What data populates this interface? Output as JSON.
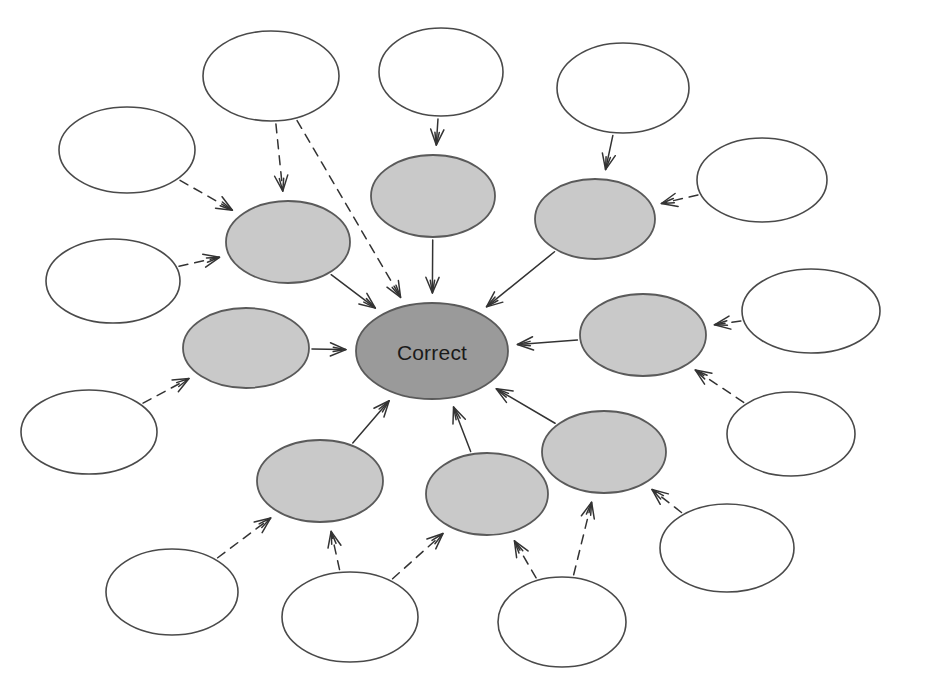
{
  "diagram": {
    "canvas": {
      "width": 925,
      "height": 688,
      "background": "#ffffff"
    },
    "palette": {
      "center_fill": "#9a9a9a",
      "inner_fill": "#c9c9c9",
      "outer_fill": "#ffffff",
      "stroke": "#4a4a4a",
      "edge": "#333333",
      "label": "#1a1a1a"
    },
    "center_node": {
      "id": "center",
      "label": "Correct",
      "cx": 432,
      "cy": 351,
      "rx": 76,
      "ry": 48,
      "fill": "#9a9a9a"
    },
    "inner_nodes": [
      {
        "id": "inner-nw",
        "label": "",
        "cx": 288,
        "cy": 242,
        "rx": 62,
        "ry": 41
      },
      {
        "id": "inner-n",
        "label": "",
        "cx": 433,
        "cy": 196,
        "rx": 62,
        "ry": 41
      },
      {
        "id": "inner-ne",
        "label": "",
        "cx": 595,
        "cy": 219,
        "rx": 60,
        "ry": 40
      },
      {
        "id": "inner-e",
        "label": "",
        "cx": 643,
        "cy": 335,
        "rx": 63,
        "ry": 41
      },
      {
        "id": "inner-se",
        "label": "",
        "cx": 604,
        "cy": 452,
        "rx": 62,
        "ry": 41
      },
      {
        "id": "inner-s",
        "label": "",
        "cx": 487,
        "cy": 494,
        "rx": 61,
        "ry": 41
      },
      {
        "id": "inner-sw",
        "label": "",
        "cx": 320,
        "cy": 481,
        "rx": 63,
        "ry": 41
      },
      {
        "id": "inner-w",
        "label": "",
        "cx": 246,
        "cy": 348,
        "rx": 63,
        "ry": 40
      }
    ],
    "outer_nodes": [
      {
        "id": "outer-1",
        "label": "",
        "cx": 271,
        "cy": 76,
        "rx": 68,
        "ry": 45
      },
      {
        "id": "outer-2",
        "label": "",
        "cx": 441,
        "cy": 72,
        "rx": 62,
        "ry": 44
      },
      {
        "id": "outer-3",
        "label": "",
        "cx": 623,
        "cy": 88,
        "rx": 66,
        "ry": 45
      },
      {
        "id": "outer-4",
        "label": "",
        "cx": 762,
        "cy": 180,
        "rx": 65,
        "ry": 42
      },
      {
        "id": "outer-5",
        "label": "",
        "cx": 127,
        "cy": 150,
        "rx": 68,
        "ry": 43
      },
      {
        "id": "outer-6",
        "label": "",
        "cx": 113,
        "cy": 281,
        "rx": 67,
        "ry": 42
      },
      {
        "id": "outer-7",
        "label": "",
        "cx": 811,
        "cy": 311,
        "rx": 69,
        "ry": 42
      },
      {
        "id": "outer-8",
        "label": "",
        "cx": 791,
        "cy": 434,
        "rx": 64,
        "ry": 42
      },
      {
        "id": "outer-9",
        "label": "",
        "cx": 89,
        "cy": 432,
        "rx": 68,
        "ry": 42
      },
      {
        "id": "outer-10",
        "label": "",
        "cx": 172,
        "cy": 592,
        "rx": 66,
        "ry": 43
      },
      {
        "id": "outer-11",
        "label": "",
        "cx": 350,
        "cy": 617,
        "rx": 68,
        "ry": 45
      },
      {
        "id": "outer-12",
        "label": "",
        "cx": 562,
        "cy": 622,
        "rx": 64,
        "ry": 45
      },
      {
        "id": "outer-13",
        "label": "",
        "cx": 727,
        "cy": 548,
        "rx": 67,
        "ry": 44
      }
    ],
    "edges": [
      {
        "id": "e-inner-nw-center",
        "from": "inner-nw",
        "to": "center",
        "style": "solid"
      },
      {
        "id": "e-inner-n-center",
        "from": "inner-n",
        "to": "center",
        "style": "solid"
      },
      {
        "id": "e-inner-ne-center",
        "from": "inner-ne",
        "to": "center",
        "style": "solid"
      },
      {
        "id": "e-inner-e-center",
        "from": "inner-e",
        "to": "center",
        "style": "solid"
      },
      {
        "id": "e-inner-se-center",
        "from": "inner-se",
        "to": "center",
        "style": "solid"
      },
      {
        "id": "e-inner-s-center",
        "from": "inner-s",
        "to": "center",
        "style": "solid"
      },
      {
        "id": "e-inner-sw-center",
        "from": "inner-sw",
        "to": "center",
        "style": "solid"
      },
      {
        "id": "e-inner-w-center",
        "from": "inner-w",
        "to": "center",
        "style": "solid"
      },
      {
        "id": "e-outer-1-inner-nw",
        "from": "outer-1",
        "to": "inner-nw",
        "style": "dashed"
      },
      {
        "id": "e-outer-1-center",
        "from": "outer-1",
        "to": "center",
        "style": "dashed"
      },
      {
        "id": "e-outer-2-inner-n",
        "from": "outer-2",
        "to": "inner-n",
        "style": "solid"
      },
      {
        "id": "e-outer-3-inner-ne",
        "from": "outer-3",
        "to": "inner-ne",
        "style": "solid"
      },
      {
        "id": "e-outer-4-inner-ne",
        "from": "outer-4",
        "to": "inner-ne",
        "style": "dashed"
      },
      {
        "id": "e-outer-5-inner-nw",
        "from": "outer-5",
        "to": "inner-nw",
        "style": "dashed"
      },
      {
        "id": "e-outer-6-inner-nw",
        "from": "outer-6",
        "to": "inner-nw",
        "style": "dashed"
      },
      {
        "id": "e-outer-7-inner-e",
        "from": "outer-7",
        "to": "inner-e",
        "style": "dashed"
      },
      {
        "id": "e-outer-8-inner-e",
        "from": "outer-8",
        "to": "inner-e",
        "style": "dashed"
      },
      {
        "id": "e-outer-9-inner-w",
        "from": "outer-9",
        "to": "inner-w",
        "style": "dashed"
      },
      {
        "id": "e-outer-10-inner-sw",
        "from": "outer-10",
        "to": "inner-sw",
        "style": "dashed"
      },
      {
        "id": "e-outer-11-inner-sw",
        "from": "outer-11",
        "to": "inner-sw",
        "style": "dashed"
      },
      {
        "id": "e-outer-11-inner-s",
        "from": "outer-11",
        "to": "inner-s",
        "style": "dashed"
      },
      {
        "id": "e-outer-12-inner-s",
        "from": "outer-12",
        "to": "inner-s",
        "style": "dashed"
      },
      {
        "id": "e-outer-12-inner-se",
        "from": "outer-12",
        "to": "inner-se",
        "style": "dashed"
      },
      {
        "id": "e-outer-13-inner-se",
        "from": "outer-13",
        "to": "inner-se",
        "style": "dashed"
      }
    ]
  }
}
